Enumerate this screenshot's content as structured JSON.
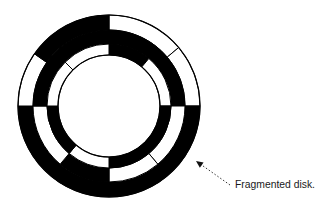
{
  "figure": {
    "caption": "Fragmented disk.",
    "colors": {
      "used": "#000000",
      "free": "#ffffff",
      "outline": "#000000",
      "background": "#ffffff"
    },
    "disk": {
      "center": [
        109,
        106
      ],
      "radii": [
        91,
        76,
        62,
        51
      ]
    },
    "bands": [
      {
        "name": "outer-track",
        "segments": [
          {
            "start": 0,
            "end": 50,
            "fill": "free"
          },
          {
            "start": 50,
            "end": 90,
            "fill": "free"
          },
          {
            "start": 90,
            "end": 270,
            "fill": "used"
          },
          {
            "start": 270,
            "end": 305,
            "fill": "free"
          },
          {
            "start": 305,
            "end": 360,
            "fill": "used"
          }
        ]
      },
      {
        "name": "middle-track",
        "segments": [
          {
            "start": 0,
            "end": 90,
            "fill": "used"
          },
          {
            "start": 90,
            "end": 140,
            "fill": "free"
          },
          {
            "start": 140,
            "end": 180,
            "fill": "free"
          },
          {
            "start": 180,
            "end": 220,
            "fill": "used"
          },
          {
            "start": 220,
            "end": 270,
            "fill": "free"
          },
          {
            "start": 270,
            "end": 360,
            "fill": "used"
          }
        ]
      },
      {
        "name": "inner-track",
        "segments": [
          {
            "start": 0,
            "end": 40,
            "fill": "used"
          },
          {
            "start": 40,
            "end": 90,
            "fill": "free"
          },
          {
            "start": 90,
            "end": 180,
            "fill": "used"
          },
          {
            "start": 180,
            "end": 220,
            "fill": "free"
          },
          {
            "start": 220,
            "end": 270,
            "fill": "used"
          },
          {
            "start": 270,
            "end": 315,
            "fill": "free"
          },
          {
            "start": 315,
            "end": 360,
            "fill": "free"
          }
        ]
      }
    ],
    "arrow": {
      "from": [
        230,
        185
      ],
      "to": [
        196,
        161
      ],
      "style": "dotted"
    }
  }
}
